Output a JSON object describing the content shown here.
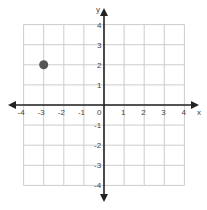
{
  "chart_data": {
    "type": "scatter",
    "title": "",
    "xlabel": "x",
    "ylabel": "y",
    "xlim": [
      -4,
      4
    ],
    "ylim": [
      -4,
      4
    ],
    "grid": true,
    "x_ticks": [
      "-4",
      "-3",
      "-2",
      "-1",
      "0",
      "1",
      "2",
      "3",
      "4"
    ],
    "y_ticks": [
      "4",
      "3",
      "2",
      "1",
      "-1",
      "-2",
      "-3",
      "-4"
    ],
    "points": [
      {
        "x": -3,
        "y": 2
      }
    ],
    "point_color": "#555555",
    "axis_color": "#222222",
    "grid_color": "#cccccc"
  }
}
